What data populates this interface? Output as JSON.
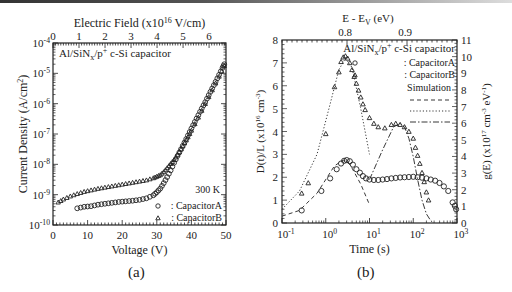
{
  "figure": {
    "panel_a_label": "(a)",
    "panel_b_label": "(b)"
  },
  "chart_data": [
    {
      "panel": "(a)",
      "type": "scatter",
      "title": "Al/SiNx/p+ c-Si capacitor",
      "xlabel": "Voltage (V)",
      "ylabel": "Current Density (A/cm2)",
      "top_xlabel": "Electric Field (x10^16 V/cm)",
      "xlim": [
        0,
        50
      ],
      "ylim_log": [
        -10,
        -4
      ],
      "yscale": "log",
      "x_ticks": [
        "0",
        "10",
        "20",
        "30",
        "40",
        "50"
      ],
      "y_ticks": [
        "10-10",
        "10-9",
        "10-8",
        "10-7",
        "10-6",
        "10-5",
        "10-4"
      ],
      "top_x_ticks": [
        "0",
        "1",
        "2",
        "3",
        "4",
        "5",
        "6"
      ],
      "annotation": "300 K",
      "legend": [
        {
          "marker": "circle",
          "label": ": CapacitorA"
        },
        {
          "marker": "triangle",
          "label": ": CapacitorB"
        }
      ],
      "series": [
        {
          "name": "CapacitorA",
          "marker": "circle",
          "x": [
            7,
            9,
            11,
            13,
            15,
            17,
            19,
            21,
            23,
            25,
            27,
            29,
            30,
            31,
            32,
            33,
            34,
            35,
            36,
            37,
            38,
            39,
            40,
            41,
            42,
            43,
            44,
            45,
            46,
            47,
            48,
            49,
            49.5
          ],
          "log10_y": [
            -9.45,
            -9.4,
            -9.38,
            -9.33,
            -9.3,
            -9.27,
            -9.24,
            -9.22,
            -9.2,
            -9.17,
            -9.12,
            -9.02,
            -8.92,
            -8.8,
            -8.62,
            -8.42,
            -8.2,
            -7.95,
            -7.72,
            -7.5,
            -7.28,
            -7.05,
            -6.82,
            -6.6,
            -6.38,
            -6.16,
            -5.95,
            -5.72,
            -5.5,
            -5.28,
            -5.05,
            -4.82,
            -4.7
          ]
        },
        {
          "name": "CapacitorB",
          "marker": "triangle",
          "x": [
            1.5,
            3,
            5,
            7,
            9,
            11,
            13,
            15,
            17,
            19,
            21,
            23,
            25,
            27,
            29,
            30,
            31,
            32,
            33,
            34,
            35,
            36,
            37,
            38,
            39,
            40,
            42,
            44,
            46,
            48,
            49.5
          ],
          "log10_y": [
            -9.25,
            -9.15,
            -9.05,
            -8.97,
            -8.9,
            -8.85,
            -8.8,
            -8.76,
            -8.72,
            -8.68,
            -8.64,
            -8.6,
            -8.56,
            -8.52,
            -8.45,
            -8.4,
            -8.35,
            -8.25,
            -8.12,
            -7.98,
            -7.85,
            -7.68,
            -7.5,
            -7.3,
            -7.1,
            -6.88,
            -6.45,
            -6.0,
            -5.55,
            -5.1,
            -4.75
          ]
        }
      ]
    },
    {
      "panel": "(b)",
      "type": "scatter",
      "title": "Al/SiNx/p+ c-Si capacitor",
      "xlabel": "Time (s)",
      "ylabel": "D(t)/L (x10^16 cm-3)",
      "y2label": "g(E) (x10^17 cm-3 eV-1)",
      "top_xlabel": "E - Ev (eV)",
      "xscale": "log",
      "xlim_log": [
        -1,
        3
      ],
      "ylim": [
        0,
        8
      ],
      "y2lim": [
        0,
        11
      ],
      "x_ticks": [
        "10-1",
        "100",
        "101",
        "102",
        "103"
      ],
      "y_ticks": [
        "0",
        "1",
        "2",
        "3",
        "4",
        "5",
        "6",
        "7",
        "8"
      ],
      "y2_ticks": [
        "0",
        "1",
        "2",
        "3",
        "4",
        "5",
        "6",
        "7",
        "8",
        "9",
        "10",
        "11"
      ],
      "top_x_ticks": [
        "0.8",
        "0.9"
      ],
      "legend": [
        {
          "marker": "circle",
          "label": ": CapacitorA"
        },
        {
          "marker": "triangle",
          "label": ": CapacitorB"
        },
        {
          "marker": "none",
          "label": "Simulation"
        },
        {
          "line": "dashed",
          "label": ""
        },
        {
          "line": "dotted",
          "label": ""
        },
        {
          "line": "dash-dot",
          "label": ""
        }
      ],
      "series": [
        {
          "name": "CapacitorA",
          "marker": "circle",
          "log10_x": [
            -0.55,
            -0.1,
            0.1,
            0.25,
            0.35,
            0.42,
            0.48,
            0.55,
            0.62,
            0.7,
            0.78,
            0.85,
            0.92,
            1.0,
            1.1,
            1.2,
            1.3,
            1.4,
            1.5,
            1.6,
            1.7,
            1.8,
            1.9,
            2.0,
            2.1,
            2.2,
            2.3,
            2.4,
            2.5,
            2.6,
            2.7,
            2.8,
            2.9,
            2.95,
            2.98
          ],
          "y": [
            0.55,
            1.4,
            1.95,
            2.35,
            2.6,
            2.72,
            2.75,
            2.7,
            2.55,
            2.35,
            2.2,
            2.05,
            1.95,
            1.9,
            1.88,
            1.88,
            1.9,
            1.92,
            1.95,
            1.97,
            1.99,
            2.0,
            2.01,
            2.02,
            2.0,
            1.98,
            1.95,
            1.9,
            1.85,
            1.75,
            1.6,
            1.4,
            0.9,
            0.75,
            0.6
          ]
        },
        {
          "name": "CapacitorB",
          "marker": "triangle",
          "log10_x": [
            -0.55,
            -0.4,
            0.0,
            0.2,
            0.3,
            0.35,
            0.4,
            0.45,
            0.5,
            0.55,
            0.6,
            0.65,
            0.7,
            0.75,
            0.8,
            0.85,
            0.9,
            1.0,
            1.1,
            1.2,
            1.35,
            1.5,
            1.6,
            1.7,
            1.8,
            1.9,
            2.0,
            2.05,
            2.1,
            2.15,
            2.2,
            2.25,
            2.3,
            2.35
          ],
          "y": [
            1.3,
            1.75,
            3.9,
            5.95,
            6.6,
            7.05,
            7.25,
            7.3,
            7.2,
            7.0,
            6.7,
            6.4,
            6.1,
            5.8,
            5.5,
            5.2,
            4.95,
            4.6,
            4.35,
            4.2,
            4.15,
            4.3,
            4.35,
            4.3,
            4.2,
            4.0,
            3.7,
            3.3,
            2.95,
            2.6,
            2.2,
            1.8,
            1.35,
            1.0
          ]
        },
        {
          "name": "Simulation dashed",
          "line": "dashed",
          "log10_x": [
            -1.0,
            -0.6,
            -0.2,
            0.2,
            0.4,
            0.5,
            0.6,
            0.8,
            1.0
          ],
          "y": [
            0.3,
            0.55,
            1.3,
            2.5,
            2.75,
            2.7,
            2.4,
            1.7,
            0.8
          ]
        },
        {
          "name": "Simulation dotted",
          "line": "dotted",
          "log10_x": [
            -1.0,
            -0.6,
            -0.2,
            0.1,
            0.3,
            0.45,
            0.6,
            0.8,
            1.0
          ],
          "y": [
            0.6,
            1.4,
            3.0,
            5.2,
            6.7,
            7.2,
            6.8,
            5.0,
            3.0
          ]
        },
        {
          "name": "Simulation dash-dot",
          "line": "dash-dot",
          "log10_x": [
            1.0,
            1.3,
            1.55,
            1.7,
            1.8,
            1.9,
            2.0,
            2.1,
            2.2,
            2.3,
            2.4,
            2.47
          ],
          "y": [
            1.9,
            3.2,
            4.2,
            4.35,
            4.2,
            3.7,
            2.9,
            1.9,
            1.0,
            0.4,
            0.1,
            0.0
          ]
        }
      ]
    }
  ]
}
